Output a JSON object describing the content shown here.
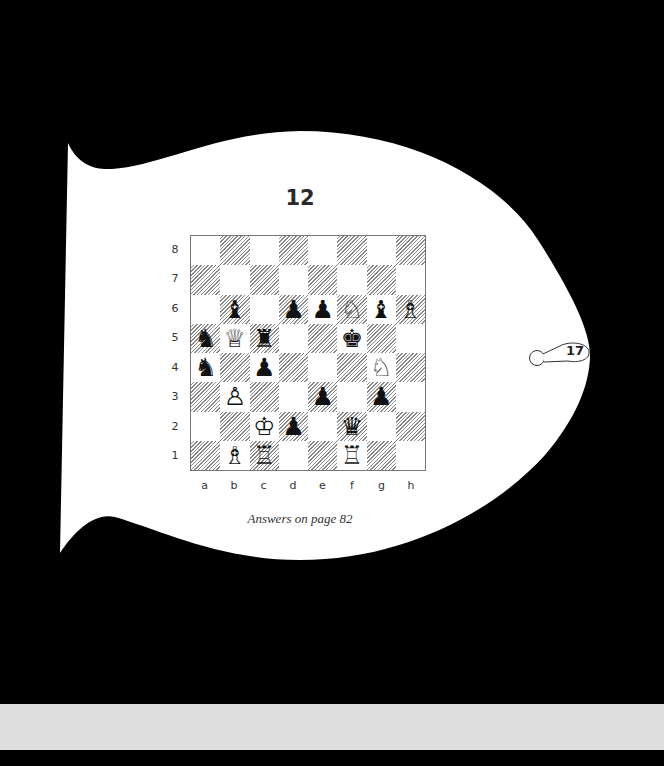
{
  "puzzle": {
    "number": "12",
    "answers_note": "Answers on page 82",
    "page_number": "17"
  },
  "board": {
    "ranks": [
      "8",
      "7",
      "6",
      "5",
      "4",
      "3",
      "2",
      "1"
    ],
    "files": [
      "a",
      "b",
      "c",
      "d",
      "e",
      "f",
      "g",
      "h"
    ],
    "position": {
      "b6": {
        "piece": "bishop",
        "color": "black",
        "glyph": "♝"
      },
      "d6": {
        "piece": "pawn",
        "color": "black",
        "glyph": "♟"
      },
      "e6": {
        "piece": "pawn",
        "color": "black",
        "glyph": "♟"
      },
      "f6": {
        "piece": "knight",
        "color": "white",
        "glyph": "♘"
      },
      "g6": {
        "piece": "bishop",
        "color": "black",
        "glyph": "♝"
      },
      "h6": {
        "piece": "bishop",
        "color": "white",
        "glyph": "♗"
      },
      "a5": {
        "piece": "knight",
        "color": "black",
        "glyph": "♞"
      },
      "b5": {
        "piece": "queen",
        "color": "white",
        "glyph": "♕"
      },
      "c5": {
        "piece": "rook",
        "color": "black",
        "glyph": "♜"
      },
      "f5": {
        "piece": "king",
        "color": "black",
        "glyph": "♚"
      },
      "a4": {
        "piece": "knight",
        "color": "black",
        "glyph": "♞"
      },
      "c4": {
        "piece": "pawn",
        "color": "black",
        "glyph": "♟"
      },
      "g4": {
        "piece": "knight",
        "color": "white",
        "glyph": "♘"
      },
      "b3": {
        "piece": "pawn",
        "color": "white",
        "glyph": "♙"
      },
      "e3": {
        "piece": "pawn",
        "color": "black",
        "glyph": "♟"
      },
      "g3": {
        "piece": "pawn",
        "color": "black",
        "glyph": "♟"
      },
      "c2": {
        "piece": "king",
        "color": "white",
        "glyph": "♔"
      },
      "d2": {
        "piece": "pawn",
        "color": "black",
        "glyph": "♟"
      },
      "f2": {
        "piece": "queen",
        "color": "black",
        "glyph": "♛"
      },
      "b1": {
        "piece": "bishop",
        "color": "white",
        "glyph": "♗"
      },
      "c1": {
        "piece": "rook",
        "color": "white",
        "glyph": "♖"
      },
      "f1": {
        "piece": "rook",
        "color": "white",
        "glyph": "♖"
      }
    }
  },
  "colors": {
    "background": "#000000",
    "page": "#ffffff",
    "bottom_bar": "#dedede"
  }
}
